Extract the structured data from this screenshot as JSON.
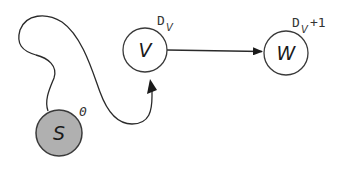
{
  "diagram": {
    "type": "graph-path",
    "nodes": [
      {
        "id": "S",
        "label": "S",
        "distance_label": "0",
        "fill": "#b0b0b0",
        "stroke": "#3a3a3a"
      },
      {
        "id": "V",
        "label": "V",
        "distance_label_main": "D",
        "distance_label_sub": "V",
        "distance_label_suffix": "",
        "fill": "#ffffff",
        "stroke": "#3a3a3a"
      },
      {
        "id": "W",
        "label": "W",
        "distance_label_main": "D",
        "distance_label_sub": "V",
        "distance_label_suffix": "+1",
        "fill": "#ffffff",
        "stroke": "#3a3a3a"
      }
    ],
    "edges": [
      {
        "from": "S",
        "to": "V",
        "style": "curved-path"
      },
      {
        "from": "V",
        "to": "W",
        "style": "straight-arrow"
      }
    ],
    "colors": {
      "line": "#2a2a2a",
      "source_fill": "#b0b0b0",
      "node_fill": "#ffffff"
    }
  }
}
